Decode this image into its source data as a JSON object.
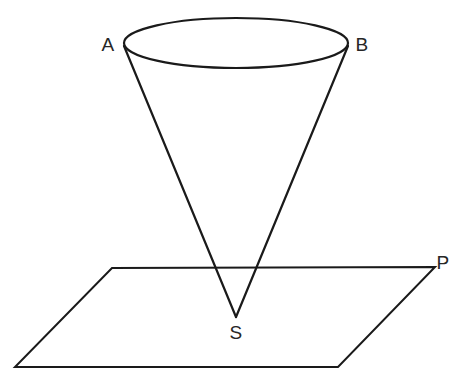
{
  "figure": {
    "background_color": "#ffffff",
    "stroke_color": "#1a1a1a",
    "label_color": "#262626",
    "width": 469,
    "height": 383,
    "labels": {
      "A": "A",
      "B": "B",
      "S": "S",
      "P": "P"
    },
    "label_positions": {
      "A": {
        "x": 108,
        "y": 44
      },
      "B": {
        "x": 362,
        "y": 44
      },
      "S": {
        "x": 236,
        "y": 332
      },
      "P": {
        "x": 443,
        "y": 262
      }
    },
    "geometry": {
      "cone": {
        "type": "cone",
        "apex": {
          "x": 236,
          "y": 317
        },
        "base_ellipse": {
          "cx": 236,
          "cy": 43,
          "rx": 112,
          "ry": 25
        },
        "rim_point_left": {
          "x": 124,
          "y": 46
        },
        "rim_point_right": {
          "x": 348,
          "y": 46
        },
        "slant_left": "M 124 46 L 236 317",
        "slant_right": "M 348 46 L 236 317"
      },
      "plane": {
        "type": "parallelogram",
        "corners": [
          {
            "x": 112,
            "y": 268
          },
          {
            "x": 435,
            "y": 267
          },
          {
            "x": 338,
            "y": 367
          },
          {
            "x": 15,
            "y": 367
          }
        ],
        "path": "M 112 268 L 435 267 L 338 367 L 15 367 Z"
      }
    },
    "ellipse_path": "M 124 43 A 112 25 0 1 0 348 43 A 112 25 0 1 0 124 43"
  }
}
